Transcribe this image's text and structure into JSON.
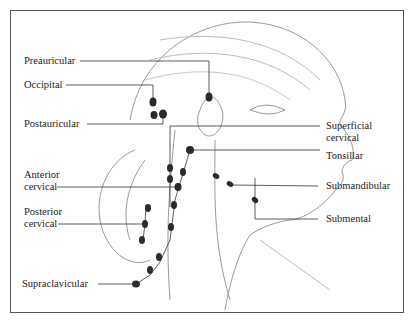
{
  "diagram": {
    "colors": {
      "line": "#333333",
      "node": "#2a2a2a",
      "sketch": "#9a9a9a",
      "frame": "#555555"
    },
    "labels_left": [
      {
        "id": "preauricular",
        "text": "Preauricular"
      },
      {
        "id": "occipital",
        "text": "Occipital"
      },
      {
        "id": "postauricular",
        "text": "Postauricular"
      },
      {
        "id": "anterior_cervical",
        "line1": "Anterior",
        "line2": "cervical"
      },
      {
        "id": "posterior_cervical",
        "line1": "Posterior",
        "line2": "cervical"
      },
      {
        "id": "supraclavicular",
        "text": "Supraclavicular"
      }
    ],
    "labels_right": [
      {
        "id": "superficial_cervical",
        "line1": "Superficial",
        "line2": "cervical"
      },
      {
        "id": "tonsillar",
        "text": "Tonsillar"
      },
      {
        "id": "submandibular",
        "text": "Submandibular"
      },
      {
        "id": "submental",
        "text": "Submental"
      }
    ]
  }
}
